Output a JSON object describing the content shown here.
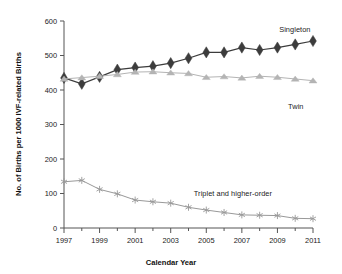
{
  "chart_data": {
    "type": "line",
    "title": "",
    "xlabel": "Calendar Year",
    "ylabel": "No. of Births per 1000 IVF-related Births",
    "x": [
      1997,
      1998,
      1999,
      2000,
      2001,
      2002,
      2003,
      2004,
      2005,
      2006,
      2007,
      2008,
      2009,
      2010,
      2011
    ],
    "xlim": [
      1997,
      2011
    ],
    "ylim": [
      0,
      600
    ],
    "ytick_labels": [
      "0",
      "100",
      "200",
      "300",
      "400",
      "500",
      "600"
    ],
    "yticks": [
      0,
      100,
      200,
      300,
      400,
      500,
      600
    ],
    "xtick_labels": [
      "1997",
      "1999",
      "2001",
      "2003",
      "2005",
      "2007",
      "2009",
      "2011"
    ],
    "xticks_major": [
      1997,
      1999,
      2001,
      2003,
      2005,
      2007,
      2009,
      2011
    ],
    "xticks_minor": [
      1998,
      2000,
      2002,
      2004,
      2006,
      2008,
      2010
    ],
    "grid": false,
    "legend_position": "inline-annotations",
    "series": [
      {
        "name": "Singleton",
        "marker": "diamond",
        "color": "#3c3c3c",
        "values": [
          435,
          418,
          438,
          459,
          465,
          469,
          478,
          492,
          509,
          509,
          523,
          516,
          523,
          532,
          542
        ]
      },
      {
        "name": "Twin",
        "marker": "triangle",
        "color": "#b4b4b4",
        "values": [
          432,
          436,
          440,
          445,
          452,
          453,
          450,
          448,
          437,
          439,
          435,
          440,
          437,
          432,
          427
        ]
      },
      {
        "name": "Triplet and higher-order",
        "marker": "asterisk",
        "color": "#999999",
        "values": [
          134,
          138,
          112,
          99,
          81,
          76,
          72,
          60,
          52,
          45,
          38,
          37,
          36,
          28,
          27
        ]
      }
    ],
    "annotations": [
      {
        "text": "Singleton",
        "x": 2009.1,
        "y": 573
      },
      {
        "text": "Twin",
        "x": 2009.6,
        "y": 352
      },
      {
        "text": "Triplet and higher-order",
        "x": 2004.3,
        "y": 100
      }
    ]
  },
  "colors": {
    "axis": "#555555",
    "singleton": "#3c3c3c",
    "twin": "#b4b4b4",
    "triplet": "#999999",
    "text": "#1a1a1a",
    "background": "#ffffff"
  }
}
